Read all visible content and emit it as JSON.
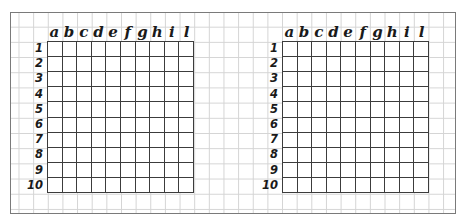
{
  "boards": [
    {
      "id": "left",
      "columns": [
        "a",
        "b",
        "c",
        "d",
        "e",
        "f",
        "g",
        "h",
        "i",
        "l"
      ],
      "rows": [
        "1",
        "2",
        "3",
        "4",
        "5",
        "6",
        "7",
        "8",
        "9",
        "10"
      ]
    },
    {
      "id": "right",
      "columns": [
        "a",
        "b",
        "c",
        "d",
        "e",
        "f",
        "g",
        "h",
        "i",
        "l"
      ],
      "rows": [
        "1",
        "2",
        "3",
        "4",
        "5",
        "6",
        "7",
        "8",
        "9",
        "10"
      ]
    }
  ],
  "colors": {
    "frame": "#7a7a7a",
    "background_grid": "#d4d4d4",
    "board_lines": "#3c3c3c",
    "label_text": "#1a1a1a"
  }
}
